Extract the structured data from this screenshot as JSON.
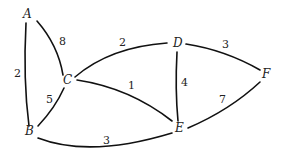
{
  "graph": {
    "type": "weighted-undirected-graph",
    "nodes": [
      {
        "id": "A",
        "label": "A",
        "x": 28,
        "y": 18
      },
      {
        "id": "B",
        "label": "B",
        "x": 29,
        "y": 135
      },
      {
        "id": "C",
        "label": "C",
        "x": 67,
        "y": 83
      },
      {
        "id": "D",
        "label": "D",
        "x": 178,
        "y": 47
      },
      {
        "id": "E",
        "label": "E",
        "x": 179,
        "y": 131
      },
      {
        "id": "F",
        "label": "F",
        "x": 266,
        "y": 77
      }
    ],
    "edges": [
      {
        "from": "A",
        "to": "B",
        "weight": "2",
        "label_x": 14,
        "label_y": 77
      },
      {
        "from": "A",
        "to": "C",
        "weight": "8",
        "label_x": 60,
        "label_y": 45
      },
      {
        "from": "C",
        "to": "B",
        "weight": "5",
        "label_x": 46,
        "label_y": 102
      },
      {
        "from": "C",
        "to": "D",
        "weight": "2",
        "label_x": 119,
        "label_y": 46
      },
      {
        "from": "C",
        "to": "E",
        "weight": "1",
        "label_x": 129,
        "label_y": 89
      },
      {
        "from": "D",
        "to": "E",
        "weight": "4",
        "label_x": 181,
        "label_y": 86
      },
      {
        "from": "D",
        "to": "F",
        "weight": "3",
        "label_x": 223,
        "label_y": 48
      },
      {
        "from": "E",
        "to": "F",
        "weight": "7",
        "label_x": 220,
        "label_y": 103
      },
      {
        "from": "B",
        "to": "E",
        "weight": "3",
        "label_x": 104,
        "label_y": 144
      }
    ]
  }
}
